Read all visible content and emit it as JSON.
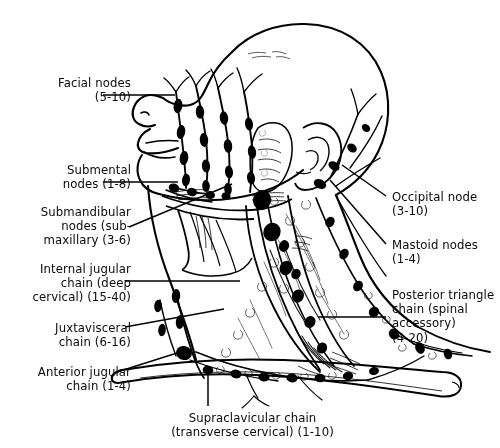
{
  "figure": {
    "background_color": "#ffffff",
    "line_color": "#000000",
    "node_fill_color": "#000000"
  },
  "labels": [
    {
      "id": "facial-nodes",
      "text": "Facial nodes\n(5-10)",
      "name": "Facial nodes",
      "count_range": "5-10",
      "align": "right",
      "x": 16,
      "y": 76,
      "width": 115
    },
    {
      "id": "submental-nodes",
      "text": "Submental\nnodes (1-8)",
      "name": "Submental nodes",
      "count_range": "1-8",
      "align": "right",
      "x": 16,
      "y": 163,
      "width": 115
    },
    {
      "id": "submandibular-nodes",
      "text": "Submandibular\nnodes (sub-\nmaxillary (3-6)",
      "name": "Submandibular nodes (submaxillary)",
      "count_range": "3-6",
      "align": "right",
      "x": 6,
      "y": 205,
      "width": 125
    },
    {
      "id": "internal-jugular-chain",
      "text": "Internal jugular\nchain (deep\ncervical) (15-40)",
      "name": "Internal jugular chain (deep cervical)",
      "count_range": "15-40",
      "align": "right",
      "x": 6,
      "y": 262,
      "width": 125
    },
    {
      "id": "juxtavisceral-chain",
      "text": "Juxtavisceral\nchain (6-16)",
      "name": "Juxtavisceral chain",
      "count_range": "6-16",
      "align": "right",
      "x": 16,
      "y": 321,
      "width": 115
    },
    {
      "id": "anterior-jugular-chain",
      "text": "Anterior jugular\nchain (1-4)",
      "name": "Anterior jugular chain",
      "count_range": "1-4",
      "align": "right",
      "x": 10,
      "y": 365,
      "width": 121
    },
    {
      "id": "occipital-node",
      "text": "Occipital node\n(3-10)",
      "name": "Occipital node",
      "count_range": "3-10",
      "align": "left",
      "x": 392,
      "y": 190,
      "width": 108
    },
    {
      "id": "mastoid-nodes",
      "text": "Mastoid nodes\n(1-4)",
      "name": "Mastoid nodes",
      "count_range": "1-4",
      "align": "left",
      "x": 392,
      "y": 238,
      "width": 108
    },
    {
      "id": "posterior-triangle-chain",
      "text": "Posterior triangle\nchain (spinal\naccessory)\n(4-20)",
      "name": "Posterior triangle chain (spinal accessory)",
      "count_range": "4-20",
      "align": "left",
      "x": 392,
      "y": 288,
      "width": 108
    },
    {
      "id": "supraclavicular-chain",
      "text": "Supraclavicular chain\n(transverse cervical) (1-10)",
      "name": "Supraclavicular chain (transverse cervical)",
      "count_range": "1-10",
      "align": "center",
      "x": 110,
      "y": 411,
      "width": 285
    }
  ],
  "leaders": [
    {
      "id": "leader-facial-nodes",
      "points": "103,95 175,95"
    },
    {
      "id": "leader-submental-nodes",
      "points": "103,182 178,182"
    },
    {
      "id": "leader-submandibular-nodes",
      "points": "129,227 232,184"
    },
    {
      "id": "leader-internal-jugular",
      "points": "125,281 240,281"
    },
    {
      "id": "leader-juxtavisceral",
      "points": "125,327 224,309"
    },
    {
      "id": "leader-anterior-jugular",
      "points": "114,373 177,353"
    },
    {
      "id": "leader-occipital-node",
      "points": "386,196 342,165"
    },
    {
      "id": "leader-mastoid-nodes",
      "points": "386,244 330,180"
    },
    {
      "id": "leader-posterior-triangle",
      "points": "386,317 318,317"
    },
    {
      "id": "leader-supraclavicular",
      "points": "208,375 208,406"
    }
  ]
}
